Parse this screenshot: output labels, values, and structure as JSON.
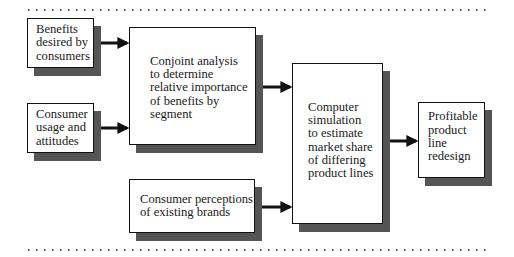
{
  "diagram": {
    "type": "flowchart",
    "nodes": [
      {
        "id": "benefits",
        "lines": [
          "Benefits",
          "desired by",
          "consumers"
        ]
      },
      {
        "id": "usage",
        "lines": [
          "Consumer",
          "usage and",
          "attitudes"
        ]
      },
      {
        "id": "conjoint",
        "lines": [
          "Conjoint analysis",
          "to determine",
          "relative importance",
          "of benefits by",
          "segment"
        ]
      },
      {
        "id": "perceptions",
        "lines": [
          "Consumer perceptions",
          "of existing brands"
        ]
      },
      {
        "id": "simulation",
        "lines": [
          "Computer",
          "simulation",
          "to estimate",
          "market share",
          "of differing",
          "product lines"
        ]
      },
      {
        "id": "redesign",
        "lines": [
          "Profitable",
          "product",
          "line",
          "redesign"
        ]
      }
    ],
    "edges": [
      {
        "from": "benefits",
        "to": "conjoint"
      },
      {
        "from": "usage",
        "to": "conjoint"
      },
      {
        "from": "conjoint",
        "to": "simulation"
      },
      {
        "from": "perceptions",
        "to": "simulation"
      },
      {
        "from": "simulation",
        "to": "redesign"
      }
    ],
    "colors": {
      "border": "#111111",
      "shadow": "#555555",
      "arrow": "#111111",
      "background": "#ffffff"
    }
  }
}
